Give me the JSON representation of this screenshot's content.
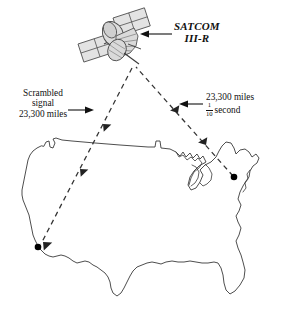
{
  "figure": {
    "title_label": "SATCOM III-R satellite relay diagram",
    "ink_color": "#222222",
    "dash_color": "#333333",
    "map_stroke": "#3a3a3a",
    "city_dot_color": "#000000"
  },
  "satellite": {
    "name_line1": "SATCOM",
    "name_line2": "III-R",
    "icon": "satellite-icon",
    "panel_color": "#e3e3e3",
    "body_color": "#d8d8d8"
  },
  "left_annotation": {
    "line1": "Scrambled",
    "line2": "signal",
    "line3": "23,300 miles",
    "pointer": "arrow-right"
  },
  "right_annotation": {
    "line1": "23,300 miles",
    "fraction_numerator": "1",
    "fraction_denominator": "10",
    "unit": "second",
    "pointer": "arrow-left"
  },
  "map": {
    "region": "united-states-outline",
    "cities": [
      {
        "name": "west-coast-city",
        "x": 38,
        "y": 247
      },
      {
        "name": "east-coast-city",
        "x": 234,
        "y": 177
      }
    ]
  },
  "signal_paths": [
    {
      "name": "uplink-east-to-satellite",
      "direction": "up-left",
      "style": "dashed"
    },
    {
      "name": "downlink-satellite-to-west",
      "direction": "down-left",
      "style": "dashed"
    }
  ]
}
